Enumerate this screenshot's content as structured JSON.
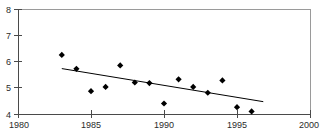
{
  "chart_data": {
    "type": "scatter",
    "title": "",
    "xlabel": "",
    "ylabel": "",
    "xlim": [
      1980,
      2000
    ],
    "ylim": [
      4,
      8
    ],
    "grid": false,
    "legend": "none",
    "x_ticks": [
      1980,
      1985,
      1990,
      1995,
      2000
    ],
    "y_ticks": [
      4,
      5,
      6,
      7,
      8
    ],
    "x": [
      1983,
      1984,
      1985,
      1986,
      1987,
      1988,
      1989,
      1990,
      1991,
      1992,
      1993,
      1994,
      1995,
      1996
    ],
    "values": [
      6.25,
      5.72,
      4.87,
      5.03,
      5.85,
      5.2,
      5.18,
      4.4,
      5.32,
      5.03,
      4.81,
      5.28,
      4.26,
      4.1
    ],
    "series": [
      {
        "name": "observations",
        "type": "scatter",
        "marker": "diamond",
        "color": "#000000",
        "x": [
          1983,
          1984,
          1985,
          1986,
          1987,
          1988,
          1989,
          1990,
          1991,
          1992,
          1993,
          1994,
          1995,
          1996
        ],
        "values": [
          6.25,
          5.72,
          4.87,
          5.03,
          5.85,
          5.2,
          5.18,
          4.4,
          5.32,
          5.03,
          4.81,
          5.28,
          4.26,
          4.1
        ]
      },
      {
        "name": "trend-line",
        "type": "line",
        "color": "#000000",
        "x": [
          1983,
          1996.8
        ],
        "values": [
          5.73,
          4.47
        ]
      }
    ],
    "annotations": []
  },
  "axes": {
    "y_tick_labels": [
      "8",
      "7",
      "6",
      "5",
      "4"
    ],
    "x_tick_labels": [
      "1980",
      "1985",
      "1990",
      "1995",
      "2000"
    ]
  },
  "header": {
    "clipped_title": ""
  }
}
